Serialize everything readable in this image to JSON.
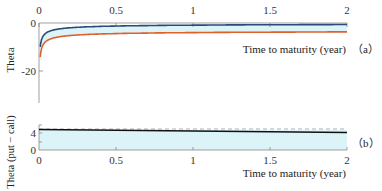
{
  "chart_data": [
    {
      "panel": "(a)",
      "type": "area",
      "title": "",
      "xlabel": "Time to maturity (year)",
      "ylabel": "Theta",
      "xlim": [
        0,
        2
      ],
      "ylim": [
        -33,
        0
      ],
      "x_ticks": [
        "0",
        "0.5",
        "1",
        "1.5",
        "2"
      ],
      "x_ticks_position": "top",
      "y_ticks": [
        "0",
        "-20"
      ],
      "series": [
        {
          "name": "upper (blue)",
          "color": "#2b4a7a",
          "x": [
            0.01,
            0.03,
            0.05,
            0.1,
            0.2,
            0.3,
            0.5,
            0.75,
            1.0,
            1.5,
            2.0
          ],
          "values": [
            -26,
            -15,
            -11.5,
            -7.5,
            -5,
            -3.8,
            -2.6,
            -1.8,
            -1.3,
            -0.8,
            -0.6
          ]
        },
        {
          "name": "lower (orange)",
          "color": "#e0602a",
          "x": [
            0.01,
            0.03,
            0.05,
            0.1,
            0.2,
            0.3,
            0.5,
            0.75,
            1.0,
            1.5,
            2.0
          ],
          "values": [
            -32,
            -20,
            -16,
            -12,
            -9.5,
            -8.3,
            -6.8,
            -5.9,
            -5.2,
            -4.4,
            -3.9
          ]
        }
      ],
      "fill_between_color": "#dff4f8",
      "grid": false
    },
    {
      "panel": "(b)",
      "type": "area",
      "title": "",
      "xlabel": "Time to maturity (year)",
      "ylabel": "Theta (put − call)",
      "xlim": [
        0,
        2
      ],
      "ylim": [
        0,
        6
      ],
      "x_ticks": [
        "0",
        "0.5",
        "1",
        "1.5",
        "2"
      ],
      "x_ticks_position": "bottom",
      "y_ticks": [
        "0",
        "4"
      ],
      "series": [
        {
          "name": "Theta (put − call)",
          "color": "#111111",
          "style": "solid",
          "x": [
            0,
            0.5,
            1.0,
            1.5,
            2.0
          ],
          "values": [
            4.9,
            4.7,
            4.5,
            4.3,
            4.1
          ]
        },
        {
          "name": "reference",
          "color": "#888888",
          "style": "dashed",
          "x": [
            0,
            2.0
          ],
          "values": [
            4.9,
            4.9
          ]
        }
      ],
      "fill_color": "#dff4f8",
      "grid": false
    }
  ],
  "labels": {
    "panel_a": "（a）",
    "panel_b": "（b）",
    "xlabel_a": "Time to maturity (year)",
    "xlabel_b": "Time to maturity (year)",
    "ylabel_a": "Theta",
    "ylabel_b": "Theta (put − call)",
    "a_xticks": [
      "0",
      "0.5",
      "1",
      "1.5",
      "2"
    ],
    "a_yticks": [
      "0",
      "-20"
    ],
    "b_xticks": [
      "0",
      "0.5",
      "1",
      "1.5",
      "2"
    ],
    "b_yticks": [
      "0",
      "4"
    ]
  }
}
